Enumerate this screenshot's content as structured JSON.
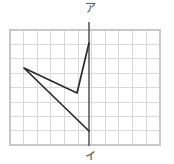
{
  "figure": {
    "background_color": "#ffffff",
    "labels": {
      "top": "ア",
      "bottom": "イ"
    },
    "colors": {
      "grid_line": "#d8d8d8",
      "grid_border": "#c8c8c8",
      "shape_stroke": "#2b2b2b",
      "axis_stroke": "#5a5a5a",
      "label_text": "#3a3a3a"
    }
  },
  "chart_data": {
    "type": "line",
    "title": "",
    "xlabel": "",
    "ylabel": "",
    "grid": true,
    "legend": "none",
    "grid_spec": {
      "x_start": 10,
      "y_start": 30,
      "x_end": 160,
      "y_end": 145,
      "columns": 11,
      "rows": 8,
      "cell_width": 13.6,
      "cell_height": 14.4
    },
    "axis_line": {
      "name": "vertical-axis",
      "x": 89,
      "y_top": 22,
      "y_bottom": 146,
      "top_label": "ア",
      "bottom_label": "イ"
    },
    "series": [
      {
        "name": "arrow-outline",
        "points": [
          [
            89,
            43
          ],
          [
            77,
            93
          ],
          [
            24,
            68
          ],
          [
            89,
            131
          ]
        ]
      }
    ],
    "annotations": [
      {
        "text": "ア",
        "x": 90,
        "y": 12,
        "anchor": "middle"
      },
      {
        "text": "イ",
        "x": 90,
        "y": 160,
        "anchor": "middle"
      }
    ]
  }
}
